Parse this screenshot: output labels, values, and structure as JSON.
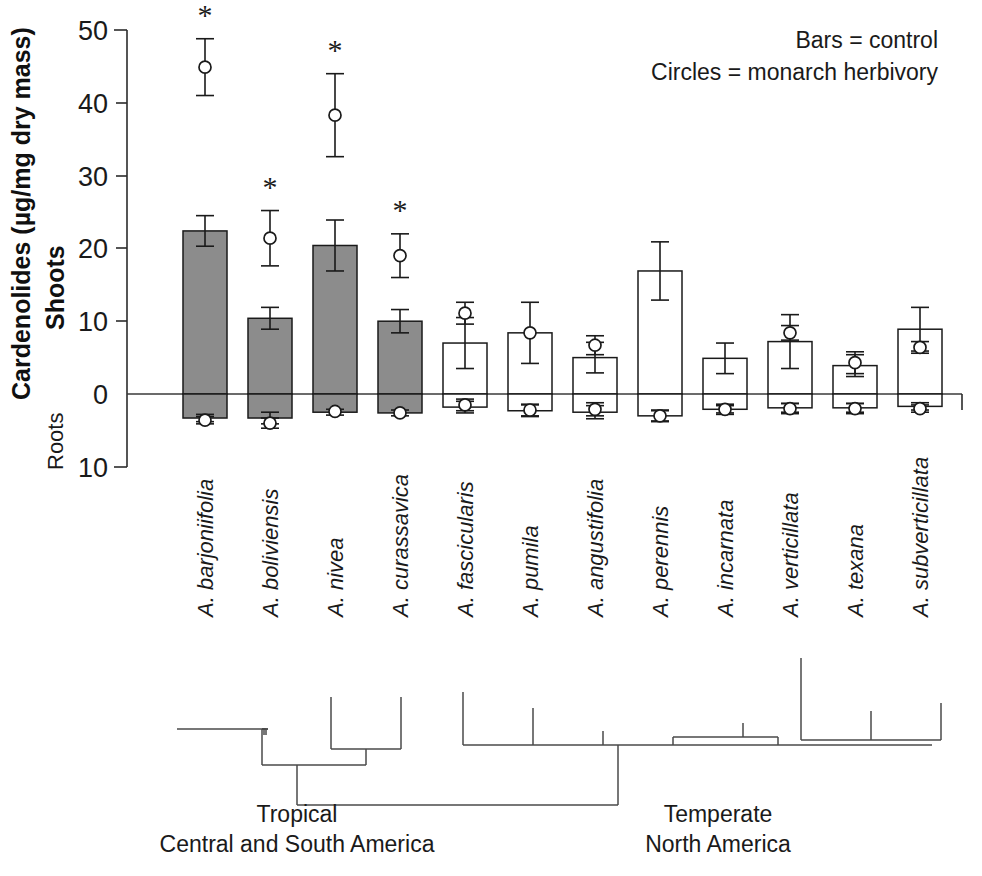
{
  "chart_data": {
    "type": "bar",
    "title": "",
    "xlabel": "",
    "ylabel": "Cardenolides (µg/mg dry mass)",
    "ylim": [
      -10,
      50
    ],
    "grid": false,
    "yticks": [
      50,
      40,
      30,
      20,
      10,
      0,
      10
    ],
    "ytick_values": [
      50,
      40,
      30,
      20,
      10,
      0,
      -10
    ],
    "axis_notes": {
      "above_zero": "Shoots",
      "below_zero": "Roots",
      "zero_reference": "0"
    },
    "legend": {
      "position": "top-right",
      "entries": [
        "Bars = control",
        "Circles = monarch herbivory"
      ]
    },
    "categories": [
      "A. barjoniifolia",
      "A. boliviensis",
      "A. nivea",
      "A. curassavica",
      "A. fascicularis",
      "A. pumila",
      "A. angustifolia",
      "A. perennis",
      "A. incarnata",
      "A. verticillata",
      "A. texana",
      "A. subverticillata"
    ],
    "series": [
      {
        "name": "Bars = control (shoots)",
        "type": "bar",
        "values": [
          22.4,
          10.4,
          20.4,
          10.0,
          7.0,
          8.4,
          5.0,
          16.9,
          4.9,
          7.2,
          3.9,
          8.9
        ],
        "errors": [
          2.1,
          1.5,
          3.5,
          1.6,
          3.5,
          4.2,
          2.1,
          4.0,
          2.1,
          3.7,
          1.5,
          3.0
        ],
        "fill": [
          "solid",
          "solid",
          "solid",
          "solid",
          "open",
          "open",
          "open",
          "open",
          "open",
          "open",
          "open",
          "open"
        ]
      },
      {
        "name": "Bars = control (roots)",
        "type": "bar",
        "values": [
          -3.3,
          -3.3,
          -2.5,
          -2.6,
          -1.8,
          -2.3,
          -2.5,
          -3.0,
          -2.1,
          -1.9,
          -1.9,
          -1.7
        ],
        "errors": [
          0.5,
          0.8,
          0.4,
          0.4,
          0.8,
          0.8,
          0.9,
          0.7,
          0.7,
          0.6,
          0.6,
          0.5
        ]
      },
      {
        "name": "Circles = monarch herbivory (shoots)",
        "type": "scatter",
        "values": [
          44.9,
          21.4,
          38.3,
          19.0,
          11.1,
          8.4,
          6.7,
          null,
          null,
          8.4,
          4.3,
          6.4
        ],
        "errors": [
          3.9,
          3.8,
          5.7,
          3.0,
          1.5,
          null,
          1.3,
          null,
          null,
          1.0,
          1.5,
          0.8
        ]
      },
      {
        "name": "Circles = monarch herbivory (roots)",
        "type": "scatter",
        "values": [
          -3.6,
          -4.0,
          -2.4,
          -2.6,
          -1.5,
          -2.2,
          -2.1,
          -3.0,
          -2.1,
          -2.0,
          -2.0,
          -2.0
        ],
        "errors": [
          0.5,
          0.7,
          null,
          null,
          0.8,
          0.8,
          0.9,
          0.8,
          0.5,
          0.7,
          0.7,
          0.5
        ]
      }
    ],
    "significance_markers": {
      "symbol": "*",
      "categories": [
        "A. barjoniifolia",
        "A. boliviensis",
        "A. nivea",
        "A. curassavica"
      ]
    },
    "annotations": [
      {
        "text": "Tropical",
        "group": "left"
      },
      {
        "text": "Central and South America",
        "group": "left"
      },
      {
        "text": "Temperate",
        "group": "right"
      },
      {
        "text": "North America",
        "group": "right"
      }
    ],
    "phylogeny": {
      "left_clade_label_line1": "Tropical",
      "left_clade_label_line2": "Central and South America",
      "right_clade_label_line1": "Temperate",
      "right_clade_label_line2": "North America"
    }
  },
  "axis": {
    "y_title": "Cardenolides (µg/mg dry mass)",
    "shoots_label": "Shoots",
    "roots_label": "Roots",
    "tick_50": "50",
    "tick_40": "40",
    "tick_30": "30",
    "tick_20": "20",
    "tick_10": "10",
    "tick_0": "0",
    "tick_neg10": "10"
  },
  "legend": {
    "line1": "Bars = control",
    "line2": "Circles = monarch herbivory"
  },
  "species": [
    {
      "label": "A. barjoniifolia"
    },
    {
      "label": "A. boliviensis"
    },
    {
      "label": "A. nivea"
    },
    {
      "label": "A. curassavica"
    },
    {
      "label": "A. fascicularis"
    },
    {
      "label": "A. pumila"
    },
    {
      "label": "A. angustifolia"
    },
    {
      "label": "A. perennis"
    },
    {
      "label": "A. incarnata"
    },
    {
      "label": "A. verticillata"
    },
    {
      "label": "A. texana"
    },
    {
      "label": "A. subverticillata"
    }
  ],
  "stars": [
    "*",
    "*",
    "*",
    "*"
  ],
  "groups": {
    "left_line1": "Tropical",
    "left_line2": "Central and South America",
    "right_line1": "Temperate",
    "right_line2": "North America"
  },
  "colors": {
    "bar_fill_solid": "#8c8c8c",
    "bar_fill_open": "#ffffff",
    "stroke": "#1a1a1a",
    "tree": "#4a4a4a",
    "background": "#ffffff"
  }
}
